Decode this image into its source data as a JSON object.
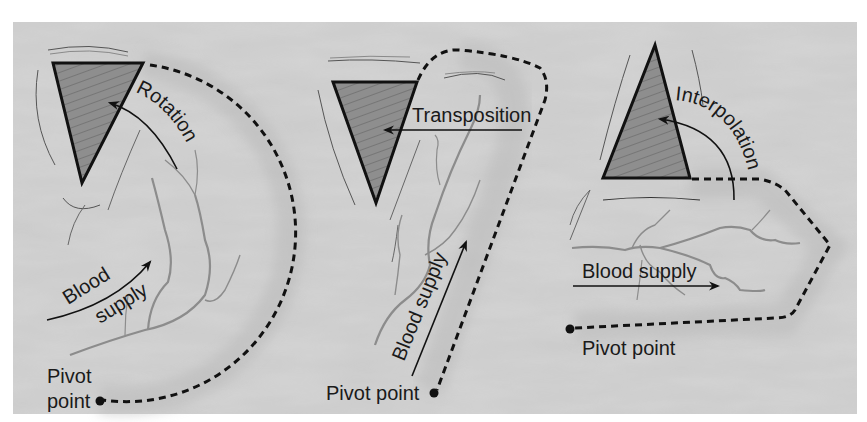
{
  "figure": {
    "colors": {
      "background": "#ffffff",
      "panel": "#c9c9c9",
      "panel_light": "#d6d6d6",
      "defect_fill": "#8a8a8a",
      "outline": "#111111",
      "vessel": "#8c8c8c",
      "text": "#1a1a1a"
    },
    "panels": [
      {
        "id": "rotation",
        "motion_label": "Rotation",
        "blood_supply_label_line1": "Blood",
        "blood_supply_label_line2": "supply",
        "pivot_label_line1": "Pivot",
        "pivot_label_line2": "point"
      },
      {
        "id": "transposition",
        "motion_label": "Transposition",
        "blood_supply_label": "Blood supply",
        "pivot_label": "Pivot point"
      },
      {
        "id": "interpolation",
        "motion_label": "Interpolation",
        "blood_supply_label": "Blood supply",
        "pivot_label": "Pivot point"
      }
    ]
  }
}
